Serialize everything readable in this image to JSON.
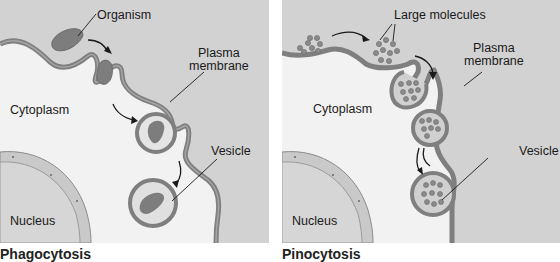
{
  "colors": {
    "extracellular": "#d2d2d2",
    "cytoplasm": "#f2f2f2",
    "membrane": "#7f7f7f",
    "membrane_inner": "#9a9a9a",
    "organism": "#7d7d7d",
    "molecule": "#8a8a8a",
    "vesicle_fill": "#c8c8c8",
    "nucleus": "#cfcfcf",
    "arrow": "#1a1a1a"
  },
  "panels": [
    {
      "caption": "Phagocytosis",
      "labels": {
        "organism": "Organism",
        "plasma_membrane": "Plasma\nmembrane",
        "plasma_membrane_line1": "Plasma",
        "plasma_membrane_line2": "membrane",
        "cytoplasm": "Cytoplasm",
        "vesicle": "Vesicle",
        "nucleus": "Nucleus"
      }
    },
    {
      "caption": "Pinocytosis",
      "labels": {
        "large_molecules": "Large molecules",
        "plasma_membrane_line1": "Plasma",
        "plasma_membrane_line2": "membrane",
        "cytoplasm": "Cytoplasm",
        "vesicle": "Vesicle",
        "nucleus": "Nucleus"
      }
    }
  ]
}
